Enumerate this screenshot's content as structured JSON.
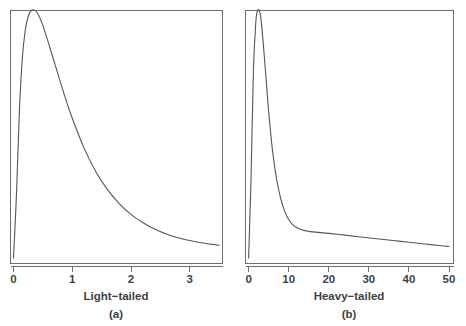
{
  "figure": {
    "background_color": "#ffffff",
    "line_color": "#555555",
    "frame_color": "#6e6e6e",
    "text_color": "#3f3f3f"
  },
  "chart_data": [
    {
      "type": "line",
      "panel_id": "a",
      "caption": "(a)",
      "title": "",
      "xlabel": "Light−tailed",
      "ylabel": "",
      "xlim": [
        -0.06,
        3.55
      ],
      "ylim": [
        0,
        1.0
      ],
      "xticks": [
        0,
        1,
        2,
        3
      ],
      "xticklabels": [
        "0",
        "1",
        "2",
        "3"
      ],
      "yticks": [],
      "yticklabels": [],
      "grid": false,
      "legend": null,
      "series": [
        {
          "name": "light-tailed density",
          "x": [
            0.0,
            0.05,
            0.1,
            0.15,
            0.2,
            0.25,
            0.3,
            0.35,
            0.4,
            0.45,
            0.5,
            0.6,
            0.7,
            0.8,
            0.9,
            1.0,
            1.2,
            1.4,
            1.6,
            1.8,
            2.0,
            2.2,
            2.4,
            2.6,
            2.8,
            3.0,
            3.2,
            3.4,
            3.5
          ],
          "y": [
            0.02,
            0.27,
            0.6,
            0.81,
            0.92,
            0.975,
            0.998,
            1.0,
            0.99,
            0.968,
            0.938,
            0.866,
            0.79,
            0.713,
            0.64,
            0.572,
            0.455,
            0.362,
            0.29,
            0.235,
            0.192,
            0.16,
            0.134,
            0.115,
            0.1,
            0.089,
            0.08,
            0.073,
            0.07
          ]
        }
      ]
    },
    {
      "type": "line",
      "panel_id": "b",
      "caption": "(b)",
      "title": "",
      "xlabel": "Heavy−tailed",
      "ylabel": "",
      "xlim": [
        -0.9,
        51.0
      ],
      "ylim": [
        0,
        1.0
      ],
      "xticks": [
        0,
        10,
        20,
        30,
        40,
        50
      ],
      "xticklabels": [
        "0",
        "10",
        "20",
        "30",
        "40",
        "50"
      ],
      "yticks": [],
      "yticklabels": [],
      "grid": false,
      "legend": null,
      "series": [
        {
          "name": "heavy-tailed density",
          "x": [
            0.0,
            0.6,
            1.2,
            1.8,
            2.2,
            2.6,
            3.0,
            3.6,
            4.2,
            5.0,
            6.0,
            7.0,
            8.0,
            9.0,
            10.0,
            11.0,
            12.0,
            13.0,
            14.0,
            15.0,
            16.0,
            18.0,
            20.0,
            24.0,
            28.0,
            32.0,
            36.0,
            40.0,
            44.0,
            48.0,
            50.0
          ],
          "y": [
            0.02,
            0.33,
            0.76,
            0.952,
            0.996,
            1.0,
            0.975,
            0.88,
            0.76,
            0.6,
            0.44,
            0.33,
            0.255,
            0.205,
            0.172,
            0.152,
            0.14,
            0.133,
            0.128,
            0.125,
            0.123,
            0.12,
            0.117,
            0.11,
            0.103,
            0.096,
            0.089,
            0.082,
            0.075,
            0.068,
            0.065
          ]
        }
      ]
    }
  ],
  "layout": {
    "panel_a": {
      "frame": {
        "x": 10,
        "y": 10,
        "width": 212,
        "height": 253
      },
      "axis_y": 266,
      "tick_length": 5,
      "tick_label_y": 283,
      "axis_title_y": 300,
      "caption_y": 318,
      "center_x": 116
    },
    "panel_b": {
      "frame": {
        "x": 12,
        "y": 10,
        "width": 208,
        "height": 253
      },
      "axis_y": 266,
      "tick_length": 5,
      "tick_label_y": 283,
      "axis_title_y": 300,
      "caption_y": 318,
      "center_x": 116
    }
  }
}
